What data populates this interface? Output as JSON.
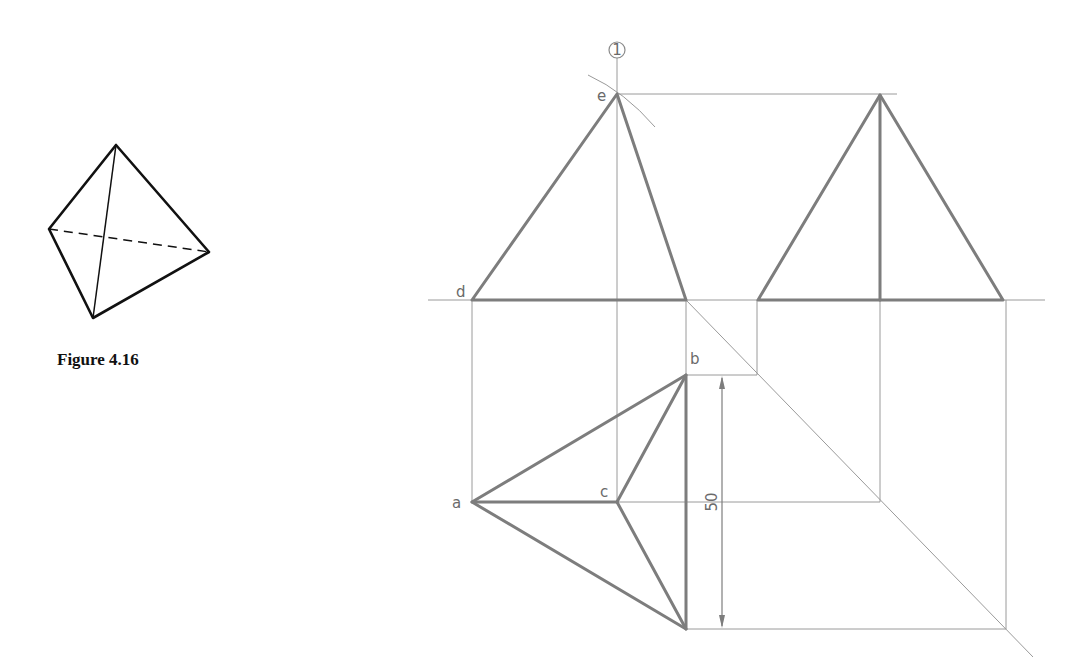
{
  "figure": {
    "caption": "Figure 4.16"
  },
  "labels": {
    "e": "e",
    "d": "d",
    "b": "b",
    "a": "a",
    "c": "c",
    "reference_number": "1",
    "dimension": "50"
  },
  "colors": {
    "thick_line": "#7d7d7d",
    "construction_line": "#9a9a9a",
    "pictorial_line": "#111111"
  }
}
